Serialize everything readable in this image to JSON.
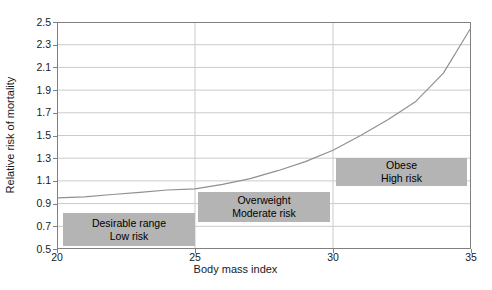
{
  "chart_data": {
    "type": "line",
    "title": "",
    "xlabel": "Body mass index",
    "ylabel": "Relative risk of mortality",
    "xlim": [
      20,
      35
    ],
    "ylim": [
      0.5,
      2.5
    ],
    "x_ticks": [
      20,
      25,
      30,
      35
    ],
    "y_ticks": [
      0.5,
      0.7,
      0.9,
      1.1,
      1.3,
      1.5,
      1.7,
      1.9,
      2.1,
      2.3,
      2.5
    ],
    "grid": {
      "vertical_lines_at_x": [
        25,
        30
      ],
      "horizontal_lines_at_y": [
        0.7,
        0.9,
        1.1,
        1.3,
        1.5,
        1.7,
        1.9,
        2.1,
        2.3
      ]
    },
    "legend": "none",
    "series": [
      {
        "name": "relative-risk-of-mortality-curve",
        "x": [
          20,
          21,
          22,
          23,
          24,
          25,
          26,
          27,
          28,
          29,
          30,
          31,
          32,
          33,
          34,
          35
        ],
        "values": [
          0.95,
          0.96,
          0.98,
          1.0,
          1.02,
          1.03,
          1.07,
          1.12,
          1.19,
          1.27,
          1.37,
          1.5,
          1.64,
          1.8,
          2.05,
          2.45
        ],
        "color": "#909090"
      }
    ],
    "annotations": [
      {
        "id": "desirable-range",
        "line1": "Desirable range",
        "line2": "Low risk",
        "x_range": [
          20.2,
          25.0
        ],
        "y_range": [
          0.53,
          0.82
        ],
        "fill": "#b4b4b4"
      },
      {
        "id": "overweight",
        "line1": "Overweight",
        "line2": "Moderate risk",
        "x_range": [
          25.1,
          29.9
        ],
        "y_range": [
          0.74,
          1.0
        ],
        "fill": "#b4b4b4"
      },
      {
        "id": "obese",
        "line1": "Obese",
        "line2": "High risk",
        "x_range": [
          30.1,
          34.85
        ],
        "y_range": [
          1.05,
          1.3
        ],
        "fill": "#b4b4b4"
      }
    ],
    "colors": {
      "gridline": "#cbcbcb",
      "axis_frame": "#808080",
      "tick_text": "#1a1a1a",
      "background": "#ffffff"
    }
  }
}
